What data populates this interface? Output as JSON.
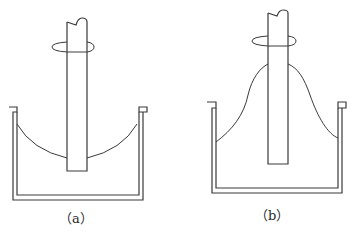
{
  "figure": {
    "panels": [
      {
        "id": "a",
        "caption": "（a）",
        "liquid_surface": "concave (dips toward rotating rod)"
      },
      {
        "id": "b",
        "caption": "（b）",
        "liquid_surface": "climbs up the rotating rod (rod-climbing / Weissenberg effect)"
      }
    ],
    "colors": {
      "stroke": "#3a3a3a",
      "background": "#ffffff"
    }
  }
}
